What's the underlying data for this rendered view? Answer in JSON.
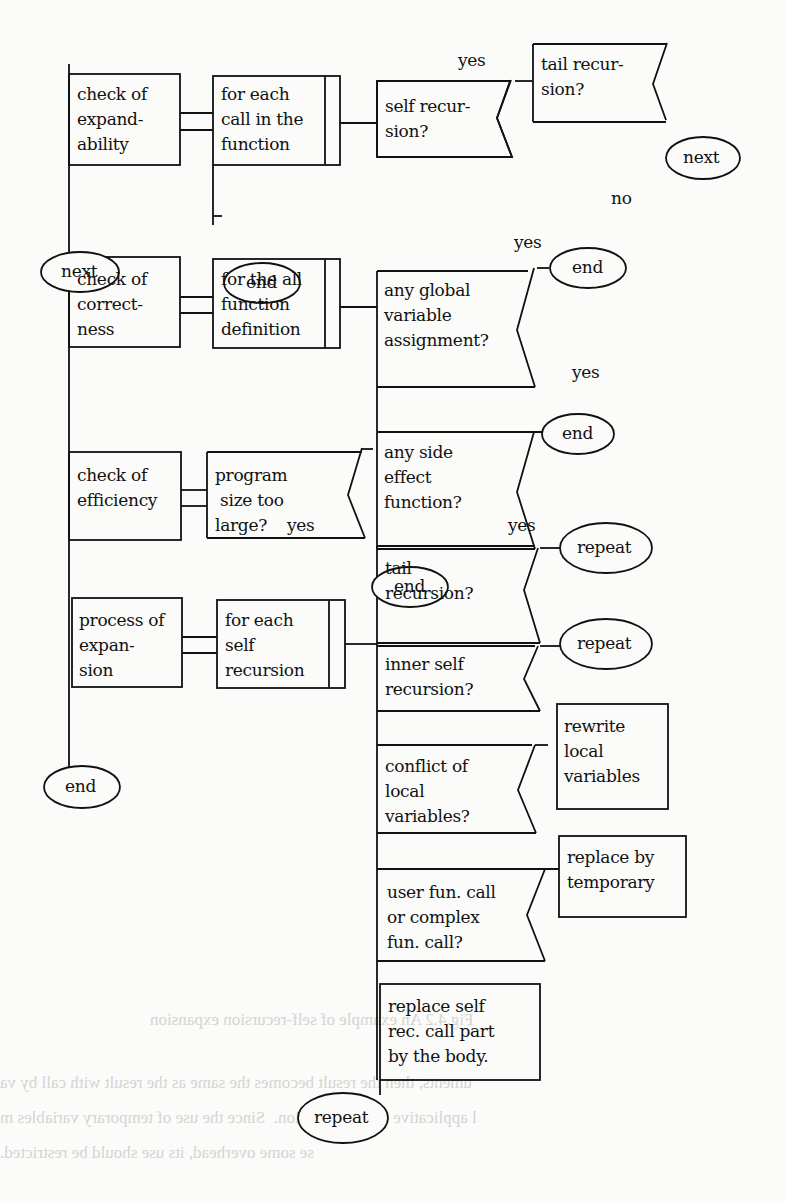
{
  "figure": {
    "show_through_text": [
      "uments, then the result becomes the same as the result with call by va",
      "l applicative order evaluation.  Since the use of temporary variables m",
      "se some overhead, its use should be restricted.",
      "Fig.4.2 An example of self-recursion expansion"
    ]
  },
  "stages": [
    {
      "id": "expandability",
      "label": "check of\nexpand-\nability",
      "loop": "for each\ncall in the\nfunction",
      "loop_end": "end"
    },
    {
      "id": "correctness",
      "label": "check of\ncorrect-\nness",
      "loop": "for the all\nfunction\ndefinition"
    },
    {
      "id": "efficiency",
      "label": "check of\nefficiency",
      "decision": "program\n size too\nlarge?"
    },
    {
      "id": "expansion",
      "label": "process of\nexpan-\nsion",
      "loop": "for each\nself\nrecursion"
    }
  ],
  "terminals": {
    "next_left": "next",
    "end_left": "end",
    "repeat_bottom": "repeat"
  },
  "decisions": {
    "self_recursion": {
      "label": "self recur-\nsion?",
      "yes": "yes"
    },
    "tail_recursion_top": {
      "label": "tail recur-\nsion?",
      "yes_target": "next",
      "no": "no"
    },
    "global_var": {
      "label": "any global\nvariable\nassignment?",
      "yes": "yes",
      "target": "end"
    },
    "side_effect": {
      "label": "any side\neffect\nfunction?",
      "yes": "yes",
      "target": "end"
    },
    "program_size": {
      "yes": "yes",
      "target": "end"
    },
    "tail_recursion": {
      "label": "tail\nrecursion?",
      "yes": "yes",
      "target": "repeat"
    },
    "inner_self": {
      "label": "inner self\nrecursion?",
      "target": "repeat"
    },
    "conflict_local": {
      "label": "conflict of\nlocal\nvariables?",
      "action": "rewrite\nlocal\nvariables"
    },
    "user_fun_call": {
      "label": "user fun. call\nor complex\nfun. call?",
      "action": "replace by\ntemporary"
    }
  },
  "process": {
    "replace_body": "replace self\nrec. call part\nby the body."
  }
}
